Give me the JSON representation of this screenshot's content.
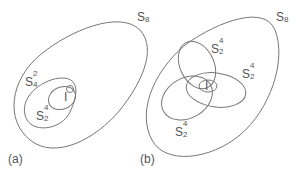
{
  "panels": [
    {
      "caption": "(a)",
      "outer": {
        "label": "S",
        "sub": "8"
      },
      "middle": {
        "label": "S",
        "sup": "2",
        "sub": "4"
      },
      "inner": {
        "label": "S",
        "sup": "4",
        "sub": "2"
      },
      "identity": "I"
    },
    {
      "caption": "(b)",
      "outer": {
        "label": "S",
        "sub": "8"
      },
      "ellipses": [
        {
          "label": "S",
          "sup": "4",
          "sub": "2"
        },
        {
          "label": "S",
          "sup": "4",
          "sub": "2"
        },
        {
          "label": "S",
          "sup": "4",
          "sub": "2"
        }
      ],
      "identity": "I"
    }
  ],
  "colors": {
    "stroke": "#777777",
    "text": "#555555"
  }
}
